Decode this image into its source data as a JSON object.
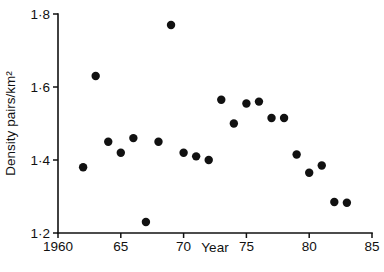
{
  "chart_data": {
    "type": "scatter",
    "title": "",
    "xlabel": "Year",
    "ylabel": "Density pairs/km2",
    "ylabel_display": "Density pairs/km²",
    "xlim": [
      1960,
      1985
    ],
    "ylim": [
      1.2,
      1.8
    ],
    "grid": false,
    "legend": null,
    "xticks": [
      1960,
      1965,
      1970,
      1975,
      1980,
      1985
    ],
    "xticklabels": [
      "1960",
      "65",
      "70",
      "75",
      "80",
      "85"
    ],
    "yticks": [
      1.2,
      1.4,
      1.6,
      1.8
    ],
    "yticklabels": [
      "1·2",
      "1·4",
      "1·6",
      "1·8"
    ],
    "marker": "circle",
    "marker_color": "#111111",
    "marker_size": 4.2,
    "x": [
      1962,
      1963,
      1964,
      1965,
      1966,
      1967,
      1968,
      1969,
      1970,
      1971,
      1972,
      1973,
      1974,
      1975,
      1976,
      1977,
      1978,
      1979,
      1980,
      1981,
      1982,
      1983
    ],
    "y": [
      1.38,
      1.63,
      1.45,
      1.42,
      1.46,
      1.23,
      1.45,
      1.77,
      1.42,
      1.41,
      1.4,
      1.565,
      1.5,
      1.555,
      1.56,
      1.515,
      1.515,
      1.415,
      1.365,
      1.385,
      1.285,
      1.283
    ],
    "points": [
      {
        "x": 1962,
        "y": 1.38
      },
      {
        "x": 1963,
        "y": 1.63
      },
      {
        "x": 1964,
        "y": 1.45
      },
      {
        "x": 1965,
        "y": 1.42
      },
      {
        "x": 1966,
        "y": 1.46
      },
      {
        "x": 1967,
        "y": 1.23
      },
      {
        "x": 1968,
        "y": 1.45
      },
      {
        "x": 1969,
        "y": 1.77
      },
      {
        "x": 1970,
        "y": 1.42
      },
      {
        "x": 1971,
        "y": 1.41
      },
      {
        "x": 1972,
        "y": 1.4
      },
      {
        "x": 1973,
        "y": 1.565
      },
      {
        "x": 1974,
        "y": 1.5
      },
      {
        "x": 1975,
        "y": 1.555
      },
      {
        "x": 1976,
        "y": 1.56
      },
      {
        "x": 1977,
        "y": 1.515
      },
      {
        "x": 1978,
        "y": 1.515
      },
      {
        "x": 1979,
        "y": 1.415
      },
      {
        "x": 1980,
        "y": 1.365
      },
      {
        "x": 1981,
        "y": 1.385
      },
      {
        "x": 1982,
        "y": 1.285
      },
      {
        "x": 1983,
        "y": 1.283
      }
    ]
  },
  "layout": {
    "plot_left": 58,
    "plot_right": 372,
    "plot_top": 14,
    "plot_bottom": 233,
    "tick_len": 5,
    "x_label_y": 252,
    "y_label_x": 15
  }
}
